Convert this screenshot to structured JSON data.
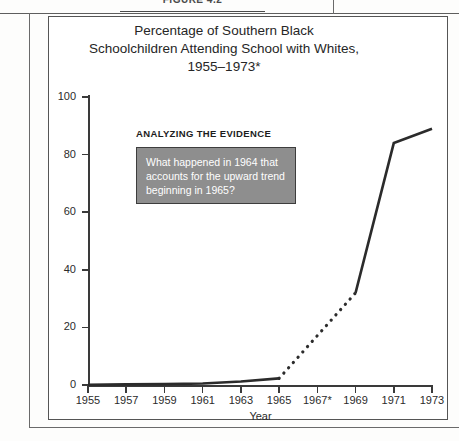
{
  "figure": {
    "caption_label": "FIGURE 4.2"
  },
  "chart_title": {
    "line1": "Percentage of Southern Black",
    "line2": "Schoolchildren Attending School with Whites,",
    "line3": "1955–1973*"
  },
  "annotation": {
    "heading": "ANALYZING THE EVIDENCE",
    "line1": "What happened in 1964 that",
    "line2": "accounts for the upward trend",
    "line3": "beginning in 1965?",
    "box_fill": "#8e8e8e",
    "box_border": "#3d3d3d",
    "text_color": "#ffffff"
  },
  "chart_data": {
    "type": "line",
    "title": "Percentage of Southern Black Schoolchildren Attending School with Whites, 1955–1973*",
    "xlabel": "Year",
    "ylabel": "",
    "x": [
      1955,
      1957,
      1959,
      1961,
      1963,
      1965,
      1967,
      1969,
      1971,
      1973
    ],
    "xtick_labels": [
      "1955",
      "1957",
      "1959",
      "1961",
      "1963",
      "1965",
      "1967*",
      "1969",
      "1971",
      "1973"
    ],
    "ytick_labels": [
      "0",
      "20",
      "40",
      "60",
      "80",
      "100"
    ],
    "ytick_values": [
      0,
      20,
      40,
      60,
      80,
      100
    ],
    "xlim": [
      1955,
      1973
    ],
    "ylim": [
      0,
      100
    ],
    "grid": false,
    "legend": false,
    "line_color": "#2b2b2b",
    "series": [
      {
        "name": "Percentage attending school with whites",
        "style": "solid",
        "points": [
          {
            "x": 1955,
            "y": 0.1
          },
          {
            "x": 1957,
            "y": 0.2
          },
          {
            "x": 1959,
            "y": 0.3
          },
          {
            "x": 1961,
            "y": 0.5
          },
          {
            "x": 1963,
            "y": 1.2
          },
          {
            "x": 1965,
            "y": 2.3
          }
        ]
      },
      {
        "name": "Interpolated gap 1965–1969",
        "style": "dotted",
        "points": [
          {
            "x": 1965,
            "y": 2.3
          },
          {
            "x": 1969,
            "y": 32
          }
        ]
      },
      {
        "name": "Percentage attending school with whites (continued)",
        "style": "solid",
        "points": [
          {
            "x": 1969,
            "y": 32
          },
          {
            "x": 1971,
            "y": 84
          },
          {
            "x": 1973,
            "y": 89
          }
        ]
      }
    ]
  }
}
